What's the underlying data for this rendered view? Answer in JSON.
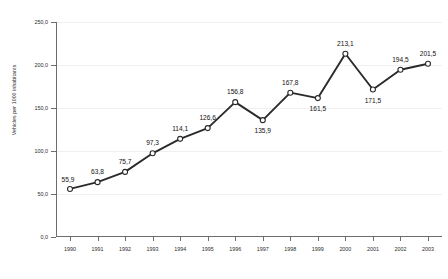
{
  "chart_data": {
    "type": "line",
    "title": "",
    "xlabel": "",
    "ylabel": "Vehicles per 1000 inhabitants",
    "ylim": [
      0.0,
      250.0
    ],
    "grid": true,
    "legend": "none",
    "decimal_separator": ",",
    "marker": "open-circle",
    "line_color": "#2a2a2a",
    "categories": [
      "1990",
      "1991",
      "1992",
      "1993",
      "1994",
      "1995",
      "1996",
      "1997",
      "1998",
      "1999",
      "2000",
      "2001",
      "2002",
      "2003"
    ],
    "values": [
      55.9,
      63.8,
      75.7,
      97.3,
      114.1,
      126.6,
      156.8,
      135.9,
      167.8,
      161.5,
      213.1,
      171.5,
      194.5,
      201.5
    ],
    "point_labels": [
      "55,9",
      "63,8",
      "75,7",
      "97,3",
      "114,1",
      "126,6",
      "156,8",
      "135,9",
      "167,8",
      "161,5",
      "213,1",
      "171,5",
      "194,5",
      "201,5"
    ],
    "yticks": [
      0.0,
      50.0,
      100.0,
      150.0,
      200.0,
      250.0
    ],
    "ytick_labels": [
      "0,0",
      "50,0",
      "100,0",
      "150,0",
      "200,0",
      "250,0"
    ]
  }
}
